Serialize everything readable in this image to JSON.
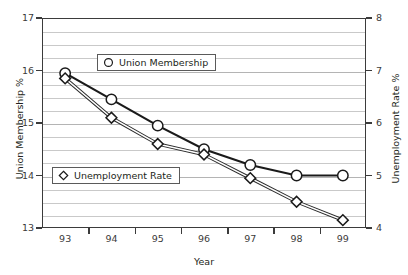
{
  "chart_data": {
    "type": "line",
    "title": "",
    "xlabel": "Year",
    "x": [
      "93",
      "94",
      "95",
      "96",
      "97",
      "98",
      "99"
    ],
    "grid": true,
    "legend_position": "inside-plot",
    "axes": {
      "left": {
        "label": "Union Membership %",
        "ticks": [
          "17",
          "16",
          "15",
          "14",
          "13"
        ],
        "tick_values": [
          17,
          16,
          15,
          14,
          13
        ],
        "ylim": [
          13,
          17
        ],
        "minor_subdivisions": 4
      },
      "right": {
        "label": "Unemployment Rate %",
        "ticks": [
          "8",
          "7",
          "6",
          "5",
          "4"
        ],
        "tick_values": [
          8,
          7,
          6,
          5,
          4
        ],
        "ylim": [
          4,
          8
        ],
        "minor_subdivisions": 4
      }
    },
    "series": [
      {
        "name": "Union Membership",
        "axis": "left",
        "marker": "circle",
        "color": "#1a1a1a",
        "values": [
          15.95,
          15.45,
          14.95,
          14.5,
          14.2,
          14.0,
          14.0
        ]
      },
      {
        "name": "Unemployment Rate",
        "axis": "right",
        "marker": "diamond",
        "color": "#444444",
        "values": [
          6.85,
          6.1,
          5.6,
          5.4,
          4.95,
          4.5,
          4.15
        ]
      }
    ]
  },
  "legend": {
    "union": "Union Membership",
    "unemployment": "Unemployment Rate"
  }
}
